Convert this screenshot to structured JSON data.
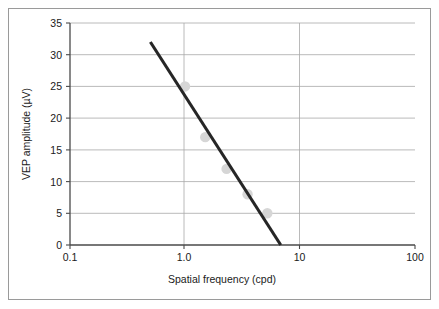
{
  "figure": {
    "border_color": "#9a9a9a",
    "background": "#ffffff"
  },
  "chart_data": {
    "type": "scatter",
    "title": "",
    "xlabel": "Spatial frequency (cpd)",
    "ylabel": "VEP amplitude (µV)",
    "xscale": "log",
    "yscale": "linear",
    "xlim": [
      0.1,
      100
    ],
    "ylim": [
      0,
      35
    ],
    "grid": "horizontal",
    "legend": "none",
    "xticks": [
      0.1,
      1.0,
      10,
      100
    ],
    "xticklabels": [
      "0.1",
      "1.0",
      "10",
      "100"
    ],
    "yticks": [
      0,
      5,
      10,
      15,
      20,
      25,
      30,
      35
    ],
    "yticklabels": [
      "0",
      "5",
      "10",
      "15",
      "20",
      "25",
      "30",
      "35"
    ],
    "series": [
      {
        "name": "VEP data points",
        "type": "scatter",
        "marker": "circle",
        "color": "#d6d6d6",
        "x": [
          1.0,
          1.5,
          2.3,
          3.5,
          5.2
        ],
        "y": [
          25,
          17,
          12,
          8,
          5
        ]
      },
      {
        "name": "Regression line",
        "type": "line",
        "color": "#262626",
        "x": [
          0.5,
          6.8
        ],
        "y": [
          32,
          0
        ]
      }
    ]
  }
}
